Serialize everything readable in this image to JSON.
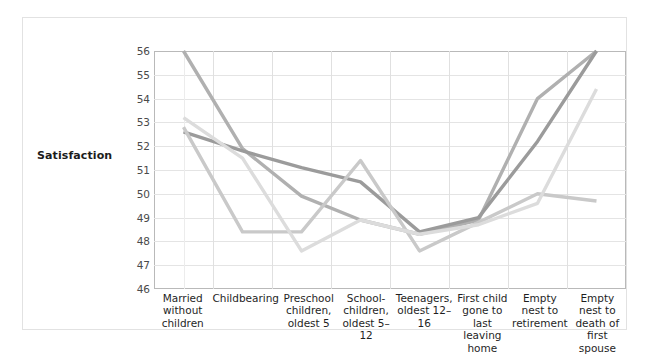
{
  "axis": {
    "ylabel": "Satisfaction",
    "yticks": [
      "56",
      "55",
      "54",
      "53",
      "52",
      "51",
      "50",
      "49",
      "48",
      "47",
      "46"
    ]
  },
  "categories": [
    "Married without children",
    "Childbearing",
    "Preschool children, oldest 5",
    "School-children, oldest 5–12",
    "Teenagers, oldest 12–16",
    "First child gone to last leaving home",
    "Empty nest to retirement",
    "Empty nest to death of first spouse"
  ],
  "colors": {
    "series_1": "#b0b0b0",
    "series_2": "#9b9b9b",
    "series_3": "#c9c9c9",
    "series_4": "#dcdcdc",
    "grid": "#e4e4e4",
    "frame": "#b9b9b9",
    "border": "#e2e2e2",
    "text": "#1f1f1f"
  },
  "chart_data": {
    "type": "line",
    "title": "",
    "xlabel": "",
    "ylabel": "Satisfaction",
    "ylim": [
      46,
      56
    ],
    "grid": true,
    "legend": "none",
    "categories": [
      "Married without children",
      "Childbearing",
      "Preschool children, oldest 5",
      "School-children, oldest 5–12",
      "Teenagers, oldest 12–16",
      "First child gone to last leaving home",
      "Empty nest to retirement",
      "Empty nest to death of first spouse"
    ],
    "tick_labels_y": [
      56,
      55,
      54,
      53,
      52,
      51,
      50,
      49,
      48,
      47,
      46
    ],
    "series": [
      {
        "name": "series_1",
        "color": "#b0b0b0",
        "values": [
          56.0,
          51.9,
          49.9,
          48.9,
          48.3,
          48.9,
          54.0,
          56.0
        ]
      },
      {
        "name": "series_2",
        "color": "#9b9b9b",
        "values": [
          52.6,
          51.8,
          51.1,
          50.5,
          48.4,
          49.0,
          52.2,
          56.0
        ]
      },
      {
        "name": "series_3",
        "color": "#c9c9c9",
        "values": [
          52.8,
          48.4,
          48.4,
          51.4,
          47.6,
          48.8,
          50.0,
          49.7
        ]
      },
      {
        "name": "series_4",
        "color": "#dcdcdc",
        "values": [
          53.2,
          51.5,
          47.6,
          48.9,
          48.3,
          48.7,
          49.6,
          54.4
        ]
      }
    ]
  }
}
